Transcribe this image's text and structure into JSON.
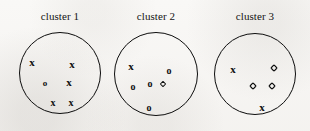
{
  "figure": {
    "background_color": "#f7f6f4",
    "ink_color": "#101010",
    "width": 310,
    "height": 131
  },
  "chart_data": {
    "type": "scatter",
    "title": "",
    "xlabel": "",
    "ylabel": "",
    "grid": false,
    "legend_position": "none",
    "clusters": [
      {
        "label": "cluster 1",
        "circle": {
          "cx": 60,
          "cy": 73,
          "r": 41
        },
        "counts": {
          "x": 5,
          "o": 1,
          "diamond": 0
        },
        "points": [
          {
            "symbol": "x",
            "x": 32,
            "y": 62,
            "size": 11
          },
          {
            "symbol": "x",
            "x": 72,
            "y": 64,
            "size": 11
          },
          {
            "symbol": "o",
            "x": 45,
            "y": 83,
            "size": 9
          },
          {
            "symbol": "x",
            "x": 69,
            "y": 82,
            "size": 11
          },
          {
            "symbol": "x",
            "x": 53,
            "y": 103,
            "size": 10
          },
          {
            "symbol": "x",
            "x": 71,
            "y": 103,
            "size": 10
          }
        ]
      },
      {
        "label": "cluster 2",
        "circle": {
          "cx": 156,
          "cy": 74,
          "r": 42
        },
        "counts": {
          "x": 1,
          "o": 4,
          "diamond": 1
        },
        "points": [
          {
            "symbol": "x",
            "x": 131,
            "y": 66,
            "size": 11
          },
          {
            "symbol": "o",
            "x": 169,
            "y": 71,
            "size": 10
          },
          {
            "symbol": "o",
            "x": 133,
            "y": 87,
            "size": 10
          },
          {
            "symbol": "o",
            "x": 150,
            "y": 84,
            "size": 10
          },
          {
            "symbol": "diamond",
            "x": 163,
            "y": 84,
            "size": 6
          },
          {
            "symbol": "o",
            "x": 149,
            "y": 108,
            "size": 10
          }
        ]
      },
      {
        "label": "cluster 3",
        "circle": {
          "cx": 255,
          "cy": 74,
          "r": 41
        },
        "counts": {
          "x": 2,
          "o": 0,
          "diamond": 3
        },
        "points": [
          {
            "symbol": "x",
            "x": 233,
            "y": 69,
            "size": 11
          },
          {
            "symbol": "diamond",
            "x": 274,
            "y": 68,
            "size": 7
          },
          {
            "symbol": "diamond",
            "x": 253,
            "y": 86,
            "size": 7
          },
          {
            "symbol": "diamond",
            "x": 272,
            "y": 86,
            "size": 7
          },
          {
            "symbol": "x",
            "x": 262,
            "y": 107,
            "size": 11
          }
        ]
      }
    ],
    "symbols": {
      "x": "x",
      "o": "o",
      "diamond": "diamond-marker"
    }
  }
}
